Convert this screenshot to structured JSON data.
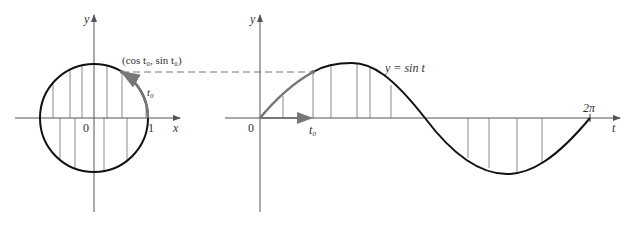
{
  "figure": {
    "left_panel": {
      "y_axis_label": "y",
      "x_axis_label": "x",
      "origin_label": "0",
      "x_tick_label": "1",
      "point_label": "(cos t₀, sin t₀)",
      "arc_label": "t₀"
    },
    "right_panel": {
      "y_axis_label": "y",
      "t_axis_label": "t",
      "origin_label": "0",
      "t0_label": "t₀",
      "end_label": "2π",
      "curve_label": "y = sin t"
    },
    "colors": {
      "curve": "#111111",
      "axis": "#555555",
      "highlight": "#777777",
      "hatch": "#888888"
    }
  }
}
